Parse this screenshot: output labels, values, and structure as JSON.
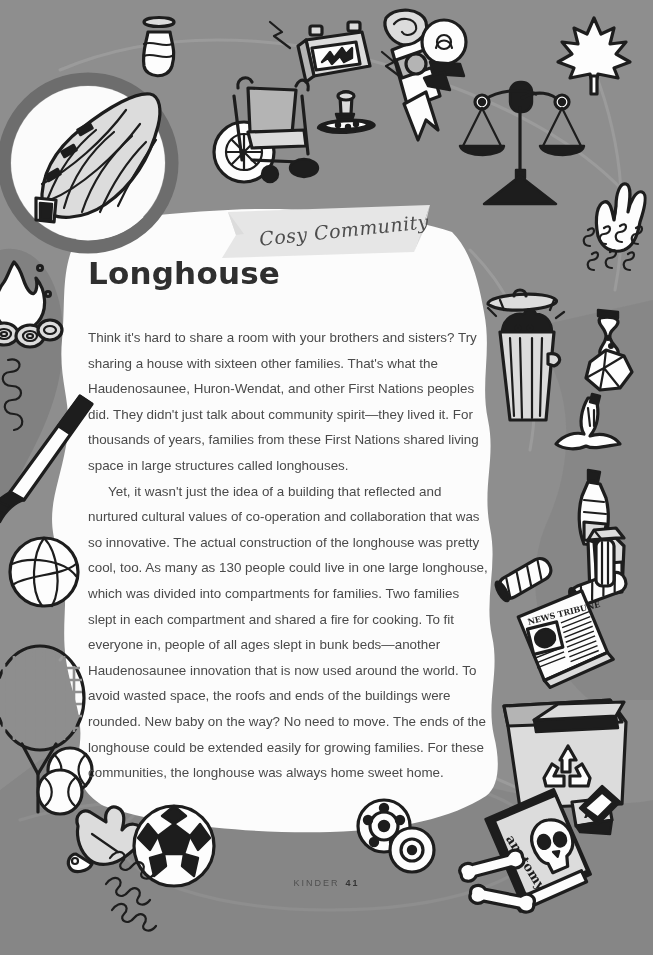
{
  "page": {
    "background_color": "#8e8e8e",
    "panel_color": "#fdfdfd",
    "ink_color": "#1d1d1d",
    "title": "Longhouse",
    "banner_label": "Cosy Community"
  },
  "article": {
    "heading": "Longhouse",
    "paragraphs": [
      "Think it's hard to share a room with your brothers and sisters? Try sharing a house with sixteen other families. That's what the Haudenosaunee, Huron-Wendat, and other First Nations peoples did. They didn't just talk about community spirit—they lived it. For thousands of years, families from these First Nations shared living space in large structures called longhouses.",
      "Yet, it wasn't just the idea of a building that reflected and nurtured cultural values of co-operation and collaboration that was so innovative. The actual construction of the longhouse was pretty cool, too. As many as 130 people could live in one large longhouse, which was divided into compartments for families. Two families slept in each compartment and shared a fire for cooking. To fit everyone in, people of all ages slept in bunk beds—another Haudenosaunee innovation that is now used around the world. To avoid wasted space, the roofs and ends of the buildings were rounded. New baby on the way? No need to move. The ends of the longhouse could be extended easily for growing families. For these communities, the longhouse was always home sweet home."
    ]
  },
  "footer": {
    "book_title": "KINDER",
    "page_number": "41"
  },
  "illustrations": {
    "badge": {
      "name": "longhouse-badge",
      "subject": "longhouse building"
    },
    "items": [
      {
        "name": "pottery-vase-icon",
        "label": "Pottery vase"
      },
      {
        "name": "wheelchair-icon",
        "label": "Wheelchair"
      },
      {
        "name": "car-battery-icon",
        "label": "Car battery"
      },
      {
        "name": "rubber-stamp-icon",
        "label": "Rubber stamp and ink pad"
      },
      {
        "name": "diploma-scroll-icon",
        "label": "Diploma scroll"
      },
      {
        "name": "lightbulb-icon",
        "label": "Light bulb"
      },
      {
        "name": "scales-of-justice-icon",
        "label": "Scales of justice"
      },
      {
        "name": "maple-leaf-icon",
        "label": "Maple leaf"
      },
      {
        "name": "peace-hand-icon",
        "label": "Peace sign hand"
      },
      {
        "name": "steam-squiggles-icon",
        "label": "Steam squiggles"
      },
      {
        "name": "campfire-icon",
        "label": "Campfire with logs"
      },
      {
        "name": "hockey-stick-icon",
        "label": "Hockey stick"
      },
      {
        "name": "volleyball-icon",
        "label": "Volleyball"
      },
      {
        "name": "tennis-racket-icon",
        "label": "Tennis racket"
      },
      {
        "name": "tennis-ball-icon",
        "label": "Tennis ball"
      },
      {
        "name": "baseball-glove-icon",
        "label": "Baseball glove"
      },
      {
        "name": "baseball-icon",
        "label": "Baseball"
      },
      {
        "name": "soccer-ball-icon",
        "label": "Soccer ball"
      },
      {
        "name": "curly-doodles-icon",
        "label": "Curly doodles"
      },
      {
        "name": "trash-can-icon",
        "label": "Trash can with garbage bag"
      },
      {
        "name": "apple-core-icon",
        "label": "Apple core"
      },
      {
        "name": "crumpled-paper-icon",
        "label": "Crumpled paper"
      },
      {
        "name": "banana-peel-icon",
        "label": "Banana peel"
      },
      {
        "name": "plastic-bottle-icon",
        "label": "Plastic bottle"
      },
      {
        "name": "milk-carton-icon",
        "label": "Milk carton"
      },
      {
        "name": "rolled-paper-icon",
        "label": "Rolled paper tubes"
      },
      {
        "name": "newspaper-icon",
        "label": "Newspaper"
      },
      {
        "name": "recycling-box-icon",
        "label": "Recycling box"
      },
      {
        "name": "film-reel-icon",
        "label": "Film reel"
      },
      {
        "name": "anatomy-book-icon",
        "label": "Anatomy book with skull"
      },
      {
        "name": "bone-icon",
        "label": "Bones"
      },
      {
        "name": "letter-block-icon",
        "label": "Letter block"
      }
    ],
    "newspaper_masthead": "NEWS TRIBUNE",
    "book_cover_title": "anatomy",
    "letter_block_glyph": "A"
  }
}
